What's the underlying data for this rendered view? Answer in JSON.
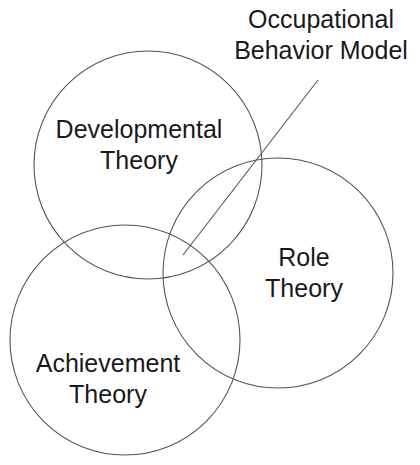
{
  "diagram": {
    "type": "venn",
    "stroke_color": "#555555",
    "text_color": "#1a1a1a",
    "background": "#ffffff",
    "circles": [
      {
        "id": "developmental",
        "cx": 148,
        "cy": 165,
        "r": 114,
        "label_line1": "Developmental",
        "label_line2": "Theory"
      },
      {
        "id": "achievement",
        "cx": 125,
        "cy": 340,
        "r": 115,
        "label_line1": "Achievement",
        "label_line2": "Theory"
      },
      {
        "id": "role",
        "cx": 278,
        "cy": 273,
        "r": 115,
        "label_line1": "Role",
        "label_line2": "Theory"
      }
    ],
    "callout": {
      "label_line1": "Occupational",
      "label_line2": "Behavior Model",
      "line": {
        "x1": 183,
        "y1": 255,
        "x2": 318,
        "y2": 80
      }
    }
  }
}
